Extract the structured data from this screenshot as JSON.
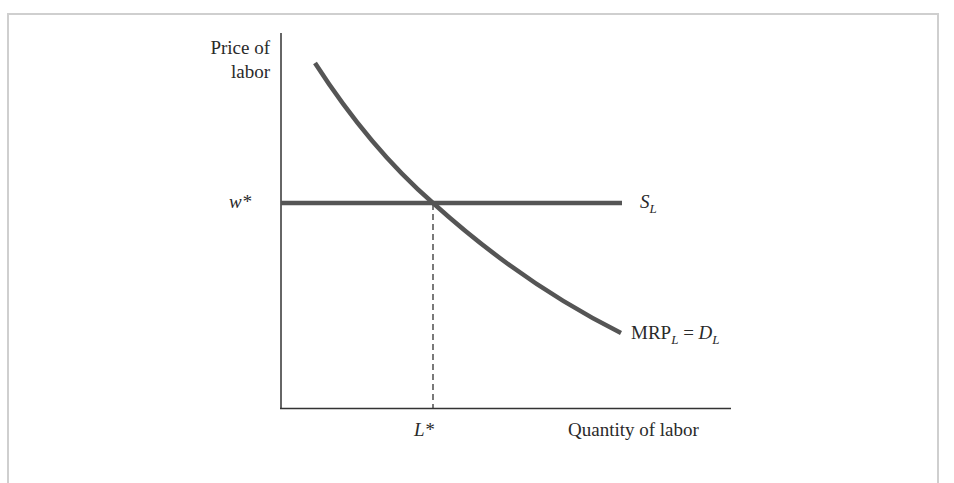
{
  "diagram": {
    "type": "labor-market-equilibrium",
    "axes": {
      "y_label_line1": "Price of",
      "y_label_line2": "labor",
      "x_label": "Quantity of labor"
    },
    "ticks": {
      "wage_equilibrium": "w*",
      "labor_equilibrium": "L*"
    },
    "curves": {
      "supply": {
        "label_main": "S",
        "label_sub": "L",
        "shape": "horizontal"
      },
      "demand": {
        "label_main": "MRP",
        "label_sub": "L",
        "label_equals": " = ",
        "label_d": "D",
        "label_d_sub": "L",
        "shape": "downward-sloping convex"
      }
    },
    "colors": {
      "curve": "#555555",
      "axis": "#333333",
      "frame": "#cfcfcf",
      "dashed": "#333333"
    }
  }
}
